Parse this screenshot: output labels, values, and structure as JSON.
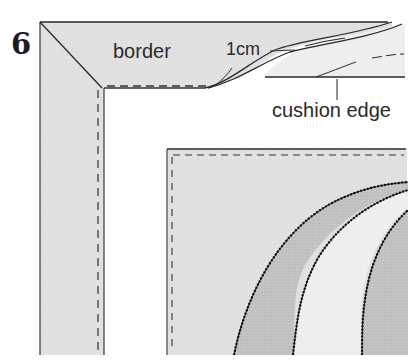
{
  "figure": {
    "step_number": "6",
    "labels": {
      "border": "border",
      "seam_allowance": "1cm",
      "cushion_edge": "cushion edge"
    },
    "colors": {
      "fabric_light": "#e4e4e4",
      "fabric_mid": "#c6c6c6",
      "fabric_pale": "#ececec",
      "outline": "#2a2a2a",
      "stitch_zigzag": "#111111",
      "background": "#ffffff"
    },
    "elements": [
      "mitred border corner",
      "dashed stitching line 1cm from edge",
      "folded cushion edge at top right",
      "cushion panel with zigzag-appliqued curved segments"
    ]
  }
}
